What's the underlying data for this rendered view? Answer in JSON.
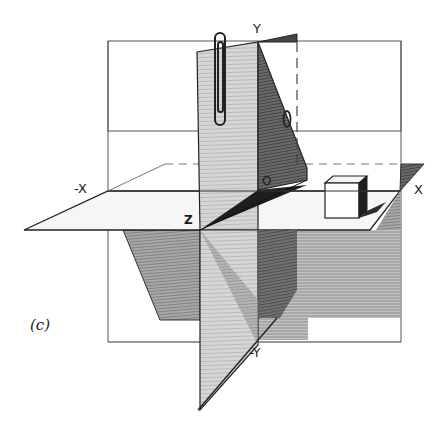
{
  "figure": {
    "caption": "(c)",
    "axis_labels": {
      "y": "Y",
      "neg_y": "-Y",
      "x": "X",
      "neg_x": "-X",
      "z": "Z",
      "origin": "O"
    },
    "colors": {
      "ink": "#1a1a1a",
      "shade_dark": "#3a3a3a",
      "shade_mid": "#8a8a8a",
      "shade_light": "#c8c8c8",
      "paper": "#ffffff"
    }
  }
}
